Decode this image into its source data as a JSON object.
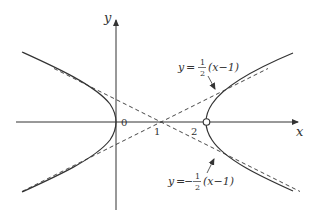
{
  "diagram": {
    "type": "hyperbola-graph",
    "axes": {
      "x_label": "x",
      "y_label": "y",
      "origin_label": "0"
    },
    "tick_labels": {
      "one": "1",
      "two": "2"
    },
    "curve": {
      "equation": "(x-1)^2 - 4y^2 = 1",
      "vertices": [
        0,
        2
      ],
      "open_point_at_x": 2
    },
    "asymptotes": [
      {
        "name": "positive",
        "prefix": "y",
        "eq_sign": "=",
        "sign": "",
        "num": "1",
        "den": "2",
        "suffix": "(x−1)"
      },
      {
        "name": "negative",
        "prefix": "y",
        "eq_sign": "=",
        "sign": "−",
        "num": "1",
        "den": "2",
        "suffix": "(x−1)"
      }
    ],
    "colors": {
      "stroke": "#333333",
      "background": "#ffffff"
    }
  }
}
